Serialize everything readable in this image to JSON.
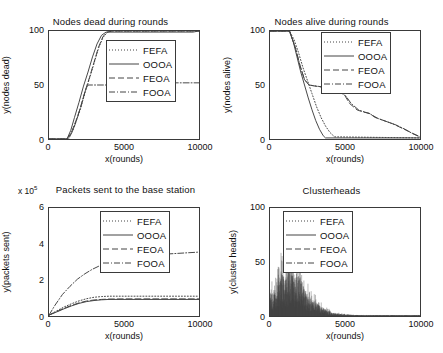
{
  "figure": {
    "width": 443,
    "height": 353,
    "background": "#ffffff",
    "line_color": "#444444"
  },
  "legend_series": [
    {
      "label": "FEFA",
      "style": "dotted"
    },
    {
      "label": "OOOA",
      "style": "solid"
    },
    {
      "label": "FEOA",
      "style": "dashed"
    },
    {
      "label": "FOOA",
      "style": "dashdot"
    }
  ],
  "chart_data": [
    {
      "id": "nodes-dead",
      "type": "line",
      "title": "Nodes dead during rounds",
      "xlabel": "x(rounds)",
      "ylabel": "y(nodes dead)",
      "xlim": [
        0,
        10000
      ],
      "ylim": [
        0,
        100
      ],
      "xticks": [
        0,
        5000,
        10000
      ],
      "xticklabels": [
        "0",
        "5000",
        "10000"
      ],
      "yticks": [
        0,
        50,
        100
      ],
      "yticklabels": [
        "0",
        "50",
        "100"
      ],
      "grid": false,
      "legend_position": "center-right",
      "series": [
        {
          "name": "FEFA",
          "style": "dotted",
          "x": [
            0,
            1200,
            1500,
            1800,
            2100,
            2400,
            2700,
            3000,
            3300,
            3600,
            3900,
            4200,
            10000
          ],
          "y": [
            0,
            0,
            6,
            16,
            28,
            43,
            56,
            70,
            84,
            94,
            99,
            100,
            100
          ]
        },
        {
          "name": "OOOA",
          "style": "solid",
          "x": [
            0,
            1200,
            1450,
            1700,
            2000,
            2300,
            2600,
            2900,
            3200,
            3500,
            3800,
            9600,
            10000
          ],
          "y": [
            0,
            0,
            8,
            20,
            34,
            49,
            62,
            76,
            88,
            96,
            99,
            99,
            100
          ]
        },
        {
          "name": "FEOA",
          "style": "dashed",
          "x": [
            0,
            1200,
            1500,
            1800,
            2100,
            2400,
            2700,
            3000,
            3300,
            3600,
            3900,
            4200,
            10000
          ],
          "y": [
            0,
            0,
            6,
            17,
            29,
            44,
            57,
            71,
            85,
            95,
            99,
            100,
            100
          ]
        },
        {
          "name": "FOOA",
          "style": "dashdot",
          "x": [
            0,
            1300,
            1600,
            1900,
            2200,
            2450,
            2600,
            2900,
            3400,
            3900,
            4000,
            10000
          ],
          "y": [
            0,
            0,
            8,
            20,
            34,
            46,
            50,
            50,
            50,
            50,
            52,
            52
          ]
        }
      ]
    },
    {
      "id": "nodes-alive",
      "type": "line",
      "title": "Nodes alive during rounds",
      "xlabel": "x(rounds)",
      "ylabel": "y(nodes alive)",
      "xlim": [
        0,
        10000
      ],
      "ylim": [
        0,
        100
      ],
      "xticks": [
        0,
        5000,
        10000
      ],
      "xticklabels": [
        "0",
        "5000",
        "10000"
      ],
      "yticks": [
        0,
        50,
        100
      ],
      "yticklabels": [
        "0",
        "50",
        "100"
      ],
      "grid": false,
      "legend_position": "top-right",
      "series": [
        {
          "name": "FEFA",
          "style": "dotted",
          "x": [
            0,
            1300,
            1600,
            1900,
            2200,
            2500,
            2800,
            3100,
            3400,
            3700,
            4000,
            4300,
            10000
          ],
          "y": [
            100,
            100,
            92,
            80,
            66,
            54,
            42,
            30,
            20,
            12,
            6,
            2,
            1
          ]
        },
        {
          "name": "OOOA",
          "style": "solid",
          "x": [
            0,
            1300,
            1550,
            1800,
            2050,
            2300,
            2550,
            2800,
            3050,
            3300,
            3550,
            3700,
            10000
          ],
          "y": [
            100,
            100,
            90,
            76,
            62,
            50,
            38,
            27,
            17,
            9,
            3,
            1,
            1
          ]
        },
        {
          "name": "FEOA",
          "style": "dashed",
          "x": [
            0,
            1300,
            1700,
            2000,
            2300,
            2600,
            3000,
            4000,
            4600,
            5000,
            5300,
            5800,
            6200,
            6600,
            7000,
            7600,
            8200,
            8800,
            9400,
            10000
          ],
          "y": [
            100,
            100,
            84,
            68,
            55,
            50,
            49,
            47,
            44,
            40,
            33,
            27,
            25,
            24,
            20,
            17,
            14,
            10,
            6,
            2
          ]
        },
        {
          "name": "FOOA",
          "style": "dashdot",
          "x": [
            0,
            1300,
            1700,
            2000,
            2300,
            2600,
            3100,
            4100,
            4700,
            5050,
            5400,
            5900,
            6300,
            6700,
            7200,
            7800,
            8400,
            9000,
            9500,
            10000
          ],
          "y": [
            100,
            100,
            84,
            68,
            55,
            50,
            49,
            47,
            44,
            40,
            33,
            27,
            25,
            23,
            19,
            16,
            13,
            9,
            5,
            2
          ]
        }
      ]
    },
    {
      "id": "packets-sent",
      "type": "line",
      "title": "Packets sent to the base station",
      "exponent_label": "x 10",
      "exponent_value": "5",
      "xlabel": "x(rounds)",
      "ylabel": "y(packets sent)",
      "xlim": [
        0,
        10000
      ],
      "ylim": [
        0,
        6
      ],
      "xticks": [
        0,
        5000,
        10000
      ],
      "xticklabels": [
        "0",
        "5000",
        "10000"
      ],
      "yticks": [
        0,
        2,
        4,
        6
      ],
      "yticklabels": [
        "0",
        "2",
        "4",
        "6"
      ],
      "grid": false,
      "legend_position": "top-right",
      "series": [
        {
          "name": "FEFA",
          "style": "dotted",
          "x": [
            0,
            500,
            1000,
            1500,
            2000,
            2500,
            3000,
            3500,
            4000,
            5000,
            6000,
            8000,
            10000
          ],
          "y": [
            0.05,
            0.28,
            0.5,
            0.68,
            0.84,
            0.96,
            1.04,
            1.08,
            1.1,
            1.1,
            1.1,
            1.1,
            1.1
          ]
        },
        {
          "name": "OOOA",
          "style": "solid",
          "x": [
            0,
            500,
            1000,
            1500,
            2000,
            2500,
            3000,
            3500,
            4000,
            5000,
            6000,
            8000,
            10000
          ],
          "y": [
            0.05,
            0.22,
            0.4,
            0.56,
            0.7,
            0.8,
            0.86,
            0.9,
            0.92,
            0.92,
            0.92,
            0.92,
            0.92
          ]
        },
        {
          "name": "FEOA",
          "style": "dashed",
          "x": [
            0,
            500,
            1000,
            1500,
            2000,
            2500,
            3000,
            3500,
            4000,
            5000,
            6000,
            8000,
            10000
          ],
          "y": [
            0.05,
            0.24,
            0.43,
            0.59,
            0.73,
            0.83,
            0.89,
            0.92,
            0.94,
            0.95,
            0.95,
            0.95,
            0.95
          ]
        },
        {
          "name": "FOOA",
          "style": "dashdot",
          "x": [
            0,
            400,
            900,
            1400,
            1900,
            2400,
            2900,
            3400,
            3900,
            4300,
            5000,
            6000,
            7000,
            8000,
            9000,
            10000
          ],
          "y": [
            0.05,
            0.6,
            1.2,
            1.65,
            2.05,
            2.35,
            2.6,
            2.8,
            3.0,
            3.1,
            3.2,
            3.3,
            3.4,
            3.45,
            3.5,
            3.55
          ]
        }
      ]
    },
    {
      "id": "clusterheads",
      "type": "line",
      "title": "Clusterheads",
      "xlabel": "x(rounds)",
      "ylabel": "y(cluster heads)",
      "xlim": [
        0,
        10000
      ],
      "ylim": [
        0,
        100
      ],
      "xticks": [
        0,
        5000,
        10000
      ],
      "xticklabels": [
        "0",
        "5000",
        "10000"
      ],
      "yticks": [
        0,
        50,
        100
      ],
      "yticklabels": [
        "0",
        "50",
        "100"
      ],
      "grid": false,
      "legend_position": "top-right",
      "description": "Dense noisy spikes of cluster head counts concentrated between rounds 0 and 3500, peaking near 86 around round 1350, decaying to near 0 after round 4000.",
      "noise_envelope": {
        "x": [
          0,
          200,
          500,
          800,
          1100,
          1350,
          1600,
          1900,
          2200,
          2500,
          2800,
          3100,
          3400,
          3800,
          4200,
          5000,
          6000,
          8000,
          10000
        ],
        "peak": [
          34,
          33,
          46,
          62,
          52,
          86,
          48,
          60,
          42,
          30,
          24,
          18,
          13,
          8,
          4,
          2,
          1,
          1,
          1
        ]
      }
    }
  ]
}
